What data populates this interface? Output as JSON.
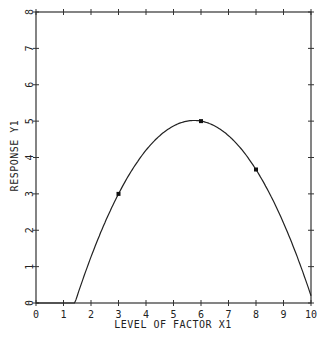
{
  "chart_data": {
    "type": "line",
    "title": "",
    "xlabel": "LEVEL OF FACTOR X1",
    "ylabel": "RESPONSE Y1",
    "xlim": [
      0,
      10
    ],
    "ylim": [
      0,
      8
    ],
    "x_ticks": [
      "0",
      "1",
      "2",
      "3",
      "4",
      "5",
      "6",
      "7",
      "8",
      "9",
      "10"
    ],
    "y_ticks": [
      "0",
      "1",
      "2",
      "3",
      "4",
      "5",
      "6",
      "7",
      "8"
    ],
    "grid": false,
    "series": [
      {
        "name": "fitted quadratic",
        "kind": "curve",
        "equation": "y = -3.8 + 3.067*x - 0.2667*x^2 (clipped at 0)",
        "x": [
          0,
          1,
          1.41,
          2,
          3,
          4,
          5,
          6,
          7,
          8,
          9,
          10
        ],
        "y": [
          0,
          0,
          0,
          1.27,
          3.0,
          4.2,
          4.87,
          5.0,
          4.6,
          3.67,
          2.2,
          0.2
        ]
      },
      {
        "name": "experimental points",
        "kind": "scatter",
        "x": [
          3,
          6,
          8
        ],
        "y": [
          3.0,
          5.0,
          3.67
        ]
      }
    ]
  }
}
